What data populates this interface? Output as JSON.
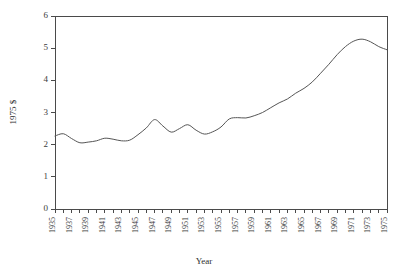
{
  "chart_data": {
    "type": "line",
    "title": "",
    "xlabel": "Year",
    "ylabel": "1975 $",
    "xlim": [
      1935,
      1975
    ],
    "ylim": [
      0,
      6
    ],
    "grid": false,
    "legend": false,
    "y_ticks": [
      0,
      1,
      2,
      3,
      4,
      5,
      6
    ],
    "x_tick_labels": [
      "1935",
      "1937",
      "1939",
      "1941",
      "1943",
      "1945",
      "1947",
      "1949",
      "1951",
      "1953",
      "1955",
      "1957",
      "1959",
      "1961",
      "1963",
      "1965",
      "1967",
      "1969",
      "1971",
      "1973",
      "1975"
    ],
    "x_minor_tick_step": 1,
    "line_color": "#555555",
    "axis_color": "#4a4a4a",
    "background_color": "#ffffff",
    "x": [
      1935,
      1936,
      1937,
      1938,
      1939,
      1940,
      1941,
      1942,
      1943,
      1944,
      1945,
      1946,
      1947,
      1948,
      1949,
      1950,
      1951,
      1952,
      1953,
      1954,
      1955,
      1956,
      1957,
      1958,
      1959,
      1960,
      1961,
      1962,
      1963,
      1964,
      1965,
      1966,
      1967,
      1968,
      1969,
      1970,
      1971,
      1972,
      1973,
      1974,
      1975
    ],
    "values": [
      2.27,
      2.34,
      2.19,
      2.06,
      2.08,
      2.12,
      2.2,
      2.17,
      2.12,
      2.14,
      2.31,
      2.52,
      2.78,
      2.58,
      2.39,
      2.5,
      2.62,
      2.45,
      2.33,
      2.4,
      2.55,
      2.8,
      2.84,
      2.83,
      2.9,
      3.0,
      3.15,
      3.3,
      3.42,
      3.6,
      3.75,
      3.95,
      4.22,
      4.5,
      4.8,
      5.05,
      5.22,
      5.28,
      5.2,
      5.05,
      4.95
    ]
  },
  "axis_titles": {
    "x": "Year",
    "y": "1975 $"
  }
}
